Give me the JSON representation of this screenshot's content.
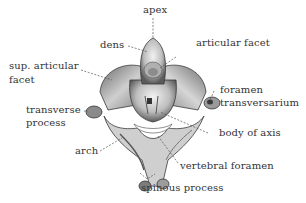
{
  "diagram": {
    "labels": {
      "apex": "apex",
      "dens": "dens",
      "articular_facet": "articular facet",
      "sup_articular_facet_line1": "sup. articular",
      "sup_articular_facet_line2": "facet",
      "foramen_transversarium_line1": "foramen",
      "foramen_transversarium_line2": "transversarium",
      "transverse_process_line1": "transverse",
      "transverse_process_line2": "process",
      "body_of_axis": "body of axis",
      "arch": "arch",
      "vertebral_foramen": "vertebral foramen",
      "spinous_process": "spinous process"
    },
    "colors": {
      "background": "#ffffff",
      "text": "#333333",
      "leader_line": "#555555",
      "bone_light": "#e6e6e6",
      "bone_mid": "#a8a8a8",
      "bone_dark": "#4a4a4a"
    }
  }
}
